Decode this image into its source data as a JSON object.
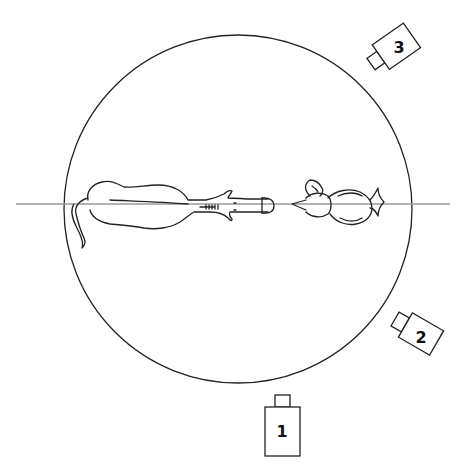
{
  "diagram": {
    "type": "camera-setup-top-view",
    "colors": {
      "stroke": "#222222",
      "axis_line": "#999999",
      "background": "#ffffff"
    },
    "arena": {
      "shape": "circle",
      "cx": 238,
      "cy": 209,
      "r": 174
    },
    "axis_line": {
      "y": 204,
      "x1": 16,
      "x2": 450
    },
    "subjects": [
      {
        "name": "horse",
        "facing": "right",
        "description": "horse viewed from above, head pointing toward center"
      },
      {
        "name": "bird",
        "facing": "left",
        "description": "bird (chick) viewed from above, beak pointing toward horse"
      }
    ],
    "cameras": [
      {
        "id": "camera-1",
        "label": "1",
        "position": "bottom",
        "rotation": 0
      },
      {
        "id": "camera-2",
        "label": "2",
        "position": "right-lower",
        "rotation": 30
      },
      {
        "id": "camera-3",
        "label": "3",
        "position": "top-right",
        "rotation": -35
      }
    ]
  }
}
